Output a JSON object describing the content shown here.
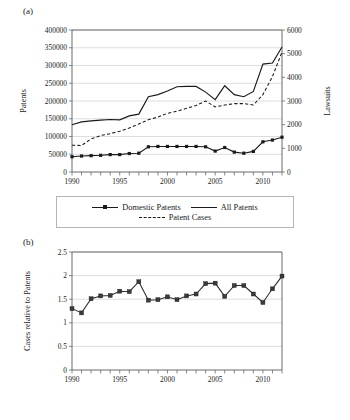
{
  "figure": {
    "panel_a_tag": "(a)",
    "panel_b_tag": "(b)"
  },
  "legend": {
    "items": [
      {
        "label": "Domestic Patents",
        "style": "line-with-square-markers"
      },
      {
        "label": "All Patents",
        "style": "solid-line"
      },
      {
        "label": "Patent Cases",
        "style": "dashed-line"
      }
    ]
  },
  "chart_data": [
    {
      "type": "line",
      "panel": "(a)",
      "title": "",
      "xlabel": "",
      "ylabel": "Patents",
      "y2label": "Lawsuits",
      "xlim": [
        1990,
        2012
      ],
      "ylim": [
        0,
        400000
      ],
      "y2lim": [
        0,
        6000
      ],
      "yticks": [
        0,
        50000,
        100000,
        150000,
        200000,
        250000,
        300000,
        350000,
        400000
      ],
      "yticklabels": [
        "0",
        "50000",
        "100000",
        "150000",
        "200000",
        "250000",
        "300000",
        "350000",
        "400000"
      ],
      "y2ticks": [
        0,
        1000,
        2000,
        3000,
        4000,
        5000,
        6000
      ],
      "y2ticklabels": [
        "0",
        "1000",
        "2000",
        "3000",
        "4000",
        "5000",
        "6000"
      ],
      "xticks": [
        1990,
        1991,
        1992,
        1993,
        1994,
        1995,
        1996,
        1997,
        1998,
        1999,
        2000,
        2001,
        2002,
        2003,
        2004,
        2005,
        2006,
        2007,
        2008,
        2009,
        2010,
        2011,
        2012
      ],
      "xticklabels_shown": [
        "1990",
        "1995",
        "2000",
        "2005",
        "2010"
      ],
      "grid": "horizontal",
      "legend_position": "below-axes",
      "x": [
        1990,
        1991,
        1992,
        1993,
        1994,
        1995,
        1996,
        1997,
        1998,
        1999,
        2000,
        2001,
        2002,
        2003,
        2004,
        2005,
        2006,
        2007,
        2008,
        2009,
        2010,
        2011,
        2012
      ],
      "series": [
        {
          "name": "Domestic Patents",
          "axis": "left",
          "units": "patents",
          "values": [
            43000,
            45000,
            46000,
            47000,
            49000,
            49000,
            52000,
            53000,
            71000,
            72000,
            72000,
            72000,
            72000,
            72000,
            71000,
            59000,
            69000,
            56000,
            53000,
            58000,
            85000,
            90000,
            98000
          ]
        },
        {
          "name": "All Patents",
          "axis": "left",
          "units": "patents",
          "values": [
            133000,
            141000,
            144000,
            146000,
            148000,
            147000,
            158000,
            163000,
            212000,
            218000,
            228000,
            240000,
            241000,
            241000,
            225000,
            204000,
            243000,
            218000,
            212000,
            227000,
            304000,
            307000,
            352000
          ]
        },
        {
          "name": "Patent Cases",
          "axis": "right",
          "units": "lawsuits",
          "values": [
            1130,
            1120,
            1400,
            1540,
            1620,
            1720,
            1860,
            2030,
            2210,
            2320,
            2480,
            2570,
            2690,
            2810,
            3000,
            2750,
            2830,
            2890,
            2890,
            2830,
            3270,
            4030,
            5070
          ]
        }
      ]
    },
    {
      "type": "line",
      "panel": "(b)",
      "title": "",
      "xlabel": "",
      "ylabel": "Cases relative to Patents",
      "xlim": [
        1990,
        2012
      ],
      "ylim": [
        0,
        2.5
      ],
      "yticks": [
        0,
        0.5,
        1,
        1.5,
        2,
        2.5
      ],
      "yticklabels": [
        "0",
        "0.5",
        "1",
        "1.5",
        "2",
        "2.5"
      ],
      "xticks": [
        1990,
        1991,
        1992,
        1993,
        1994,
        1995,
        1996,
        1997,
        1998,
        1999,
        2000,
        2001,
        2002,
        2003,
        2004,
        2005,
        2006,
        2007,
        2008,
        2009,
        2010,
        2011,
        2012
      ],
      "xticklabels_shown": [
        "1990",
        "1995",
        "2000",
        "2005",
        "2010"
      ],
      "grid": "horizontal",
      "legend_position": "none",
      "x": [
        1990,
        1991,
        1992,
        1993,
        1994,
        1995,
        1996,
        1997,
        1998,
        1999,
        2000,
        2001,
        2002,
        2003,
        2004,
        2005,
        2006,
        2007,
        2008,
        2009,
        2010,
        2011,
        2012
      ],
      "series": [
        {
          "name": "Cases relative to Patents",
          "values": [
            1.3,
            1.21,
            1.51,
            1.57,
            1.58,
            1.67,
            1.66,
            1.87,
            1.48,
            1.49,
            1.55,
            1.49,
            1.57,
            1.61,
            1.83,
            1.84,
            1.56,
            1.79,
            1.79,
            1.61,
            1.43,
            1.72,
            1.99
          ]
        }
      ]
    }
  ]
}
